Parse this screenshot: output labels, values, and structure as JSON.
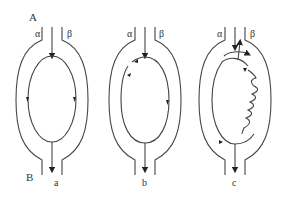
{
  "figure": {
    "corner_labels": {
      "top_left": "A",
      "bottom_left": "B"
    },
    "panels": [
      {
        "id": "a",
        "label": "a",
        "left_arm": "α",
        "right_arm": "β",
        "description": "Symmetric loop; current splits at top, flows down both arms, rejoins at bottom"
      },
      {
        "id": "b",
        "label": "b",
        "left_arm": "α",
        "right_arm": "β",
        "description": "Loop with break/arrows on upper-left arc; flow down right arm"
      },
      {
        "id": "c",
        "label": "c",
        "left_arm": "α",
        "right_arm": "β",
        "description": "Loop with wavy (photon) emission on right arm and arrows at top junction"
      }
    ]
  }
}
